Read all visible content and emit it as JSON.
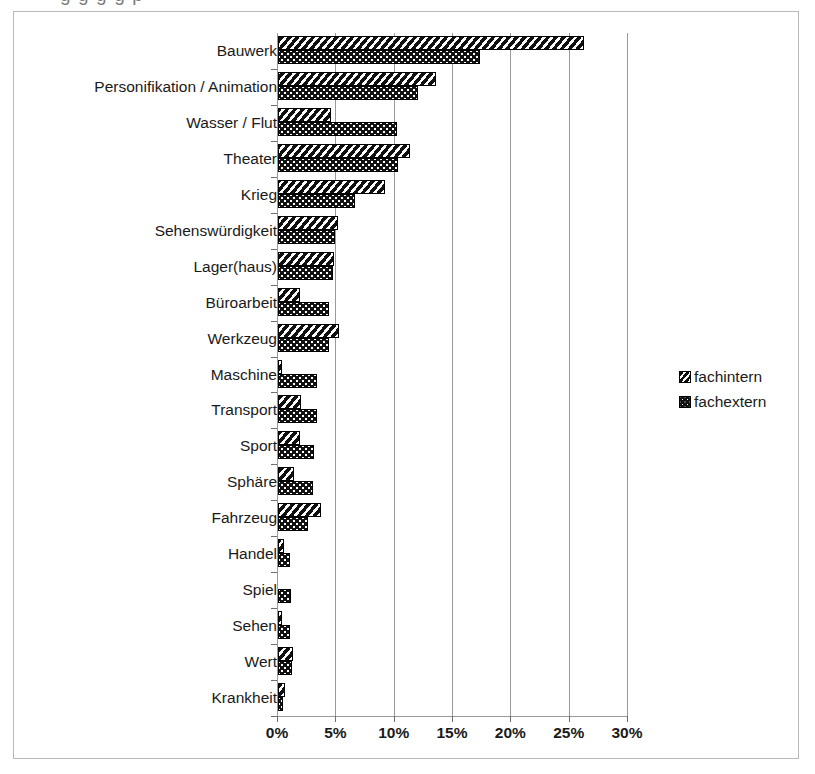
{
  "figure": {
    "clipped_heading_fragment": "g  g                    g                                  g               p",
    "legend_position": "right",
    "frame_border_color": "#b9b9b9",
    "gridline_color": "#9a9a9a",
    "bar_fill_color": "#121212"
  },
  "chart_data": {
    "type": "bar",
    "orientation": "horizontal",
    "title": "",
    "xlabel": "",
    "ylabel": "",
    "xlim": [
      0,
      30
    ],
    "xticks": [
      0,
      5,
      10,
      15,
      20,
      25,
      30
    ],
    "xtick_labels": [
      "0%",
      "5%",
      "10%",
      "15%",
      "20%",
      "25%",
      "30%"
    ],
    "grid": true,
    "categories": [
      "Bauwerk",
      "Personifikation / Animation",
      "Wasser / Flut",
      "Theater",
      "Krieg",
      "Sehenswürdigkeit",
      "Lager(haus)",
      "Büroarbeit",
      "Werkzeug",
      "Maschine",
      "Transport",
      "Sport",
      "Sphäre",
      "Fahrzeug",
      "Handel",
      "Spiel",
      "Sehen",
      "Wert",
      "Krankheit"
    ],
    "series": [
      {
        "name": "fachintern",
        "pattern": "diagonal-hatch",
        "values": [
          26.2,
          13.5,
          4.5,
          11.3,
          9.2,
          5.1,
          4.8,
          1.9,
          5.2,
          0.3,
          2.0,
          1.9,
          1.4,
          3.7,
          0.5,
          0.0,
          0.3,
          1.3,
          0.6
        ]
      },
      {
        "name": "fachextern",
        "pattern": "dotted",
        "values": [
          17.3,
          12.0,
          10.2,
          10.3,
          6.6,
          4.9,
          4.7,
          4.4,
          4.4,
          3.3,
          3.3,
          3.1,
          3.0,
          2.6,
          1.0,
          1.1,
          1.0,
          1.2,
          0.4
        ]
      }
    ]
  },
  "legend": {
    "items": [
      {
        "label": "fachintern",
        "pattern": "diagonal-hatch"
      },
      {
        "label": "fachextern",
        "pattern": "dotted"
      }
    ]
  }
}
